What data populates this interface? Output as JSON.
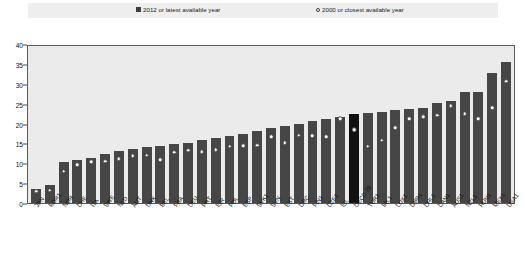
{
  "legend": {
    "series_current": "2012 or latest available year",
    "series_previous": "2000 or closest available year",
    "marker_bar": "filled-square",
    "marker_dot": "open-circle"
  },
  "colors": {
    "bar": "#464646",
    "bar_highlight": "#111111",
    "marker_fill": "#ffffff",
    "plot_background": "#ebebeb",
    "legend_background": "#eeeeee"
  },
  "caption": "",
  "chart_data": {
    "type": "bar",
    "title": "",
    "xlabel": "",
    "ylabel": "",
    "ylim": [
      0,
      40
    ],
    "yticks": [
      0,
      5,
      10,
      15,
      20,
      25,
      30,
      35,
      40
    ],
    "grid": false,
    "legend_position": "top",
    "highlight_category": "OECD 28",
    "categories": [
      "JPN",
      "KOR1",
      "NOR",
      "CHE",
      "ITA",
      "SWE",
      "NLD",
      "AUT",
      "DNK",
      "BEL",
      "FRA",
      "DEU",
      "PRT",
      "ISR",
      "POL",
      "ESP",
      "SVK1",
      "SVN",
      "EST",
      "GRC",
      "FIN1",
      "CZE1",
      "ISL",
      "OECD 28",
      "TUR1",
      "IRL1",
      "LUX1",
      "GBR1",
      "CHL1",
      "CAN1",
      "AUS1",
      "NZL1",
      "HUN1",
      "MEX1",
      "USA1"
    ],
    "series": [
      {
        "name": "2012 or latest available year",
        "type": "bar",
        "values": [
          3.5,
          4.6,
          10.5,
          11.0,
          11.5,
          12.5,
          13.2,
          13.7,
          14.2,
          14.6,
          15.0,
          15.4,
          16.0,
          16.6,
          17.0,
          17.6,
          18.4,
          19.0,
          19.6,
          20.2,
          20.8,
          21.4,
          21.8,
          22.6,
          23.0,
          23.2,
          23.6,
          24.0,
          24.1,
          25.4,
          26.1,
          28.4,
          28.4,
          33.0,
          36.0
        ]
      },
      {
        "name": "2000 or closest available year",
        "type": "scatter",
        "values": [
          3.0,
          3.2,
          8.1,
          9.8,
          10.5,
          10.6,
          11.3,
          12.0,
          12.2,
          11.0,
          12.9,
          13.4,
          13.0,
          13.6,
          14.4,
          14.6,
          14.7,
          16.8,
          15.3,
          17.3,
          17.2,
          16.9,
          21.4,
          18.6,
          14.4,
          16.0,
          19.2,
          21.5,
          22.0,
          22.4,
          24.7,
          22.7,
          21.5,
          24.3,
          31.0
        ]
      }
    ]
  }
}
